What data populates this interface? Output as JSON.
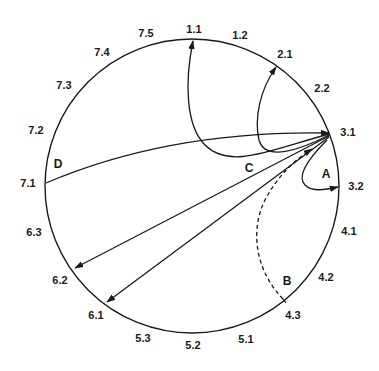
{
  "diagram": {
    "type": "circular-transition-diagram",
    "circle": {
      "cx": 192,
      "cy": 186,
      "r": 147
    },
    "positions": [
      {
        "id": "1.1",
        "label": "1.1",
        "x": 194,
        "y": 33
      },
      {
        "id": "1.2",
        "label": "1.2",
        "x": 240,
        "y": 39
      },
      {
        "id": "2.1",
        "label": "2.1",
        "x": 285,
        "y": 58
      },
      {
        "id": "2.2",
        "label": "2.2",
        "x": 322,
        "y": 92
      },
      {
        "id": "3.1",
        "label": "3.1",
        "x": 348,
        "y": 136
      },
      {
        "id": "3.2",
        "label": "3.2",
        "x": 356,
        "y": 190
      },
      {
        "id": "4.1",
        "label": "4.1",
        "x": 349,
        "y": 235
      },
      {
        "id": "4.2",
        "label": "4.2",
        "x": 326,
        "y": 281
      },
      {
        "id": "4.3",
        "label": "4.3",
        "x": 293,
        "y": 319
      },
      {
        "id": "5.1",
        "label": "5.1",
        "x": 246,
        "y": 343
      },
      {
        "id": "5.2",
        "label": "5.2",
        "x": 193,
        "y": 349
      },
      {
        "id": "5.3",
        "label": "5.3",
        "x": 143,
        "y": 342
      },
      {
        "id": "6.1",
        "label": "6.1",
        "x": 96,
        "y": 319
      },
      {
        "id": "6.2",
        "label": "6.2",
        "x": 60,
        "y": 284
      },
      {
        "id": "6.3",
        "label": "6.3",
        "x": 34,
        "y": 236
      },
      {
        "id": "7.1",
        "label": "7.1",
        "x": 28,
        "y": 187
      },
      {
        "id": "7.2",
        "label": "7.2",
        "x": 36,
        "y": 134
      },
      {
        "id": "7.3",
        "label": "7.3",
        "x": 64,
        "y": 89
      },
      {
        "id": "7.4",
        "label": "7.4",
        "x": 102,
        "y": 56
      },
      {
        "id": "7.5",
        "label": "7.5",
        "x": 146,
        "y": 37
      }
    ],
    "path_labels": [
      {
        "id": "A",
        "label": "A",
        "x": 326,
        "y": 178
      },
      {
        "id": "B",
        "label": "B",
        "x": 287,
        "y": 285
      },
      {
        "id": "C",
        "label": "C",
        "x": 249,
        "y": 172
      },
      {
        "id": "D",
        "label": "D",
        "x": 58,
        "y": 168
      }
    ],
    "edges": [
      {
        "from": "7.1",
        "to": "3.1",
        "label": "D",
        "style": "solid"
      },
      {
        "from": "3.1",
        "to": "1.1",
        "style": "solid"
      },
      {
        "from": "3.1",
        "to": "2.1",
        "style": "solid"
      },
      {
        "from": "3.1",
        "to": "6.2",
        "label": "C",
        "style": "solid"
      },
      {
        "from": "3.1",
        "to": "6.1",
        "label": "C",
        "style": "solid"
      },
      {
        "from": "4.3",
        "to": "3.1",
        "label": "B",
        "style": "dashed"
      },
      {
        "from": "3.1",
        "to": "3.2",
        "label": "A",
        "style": "solid"
      }
    ],
    "colors": {
      "stroke": "#1a1a1a",
      "background": "#ffffff"
    }
  }
}
